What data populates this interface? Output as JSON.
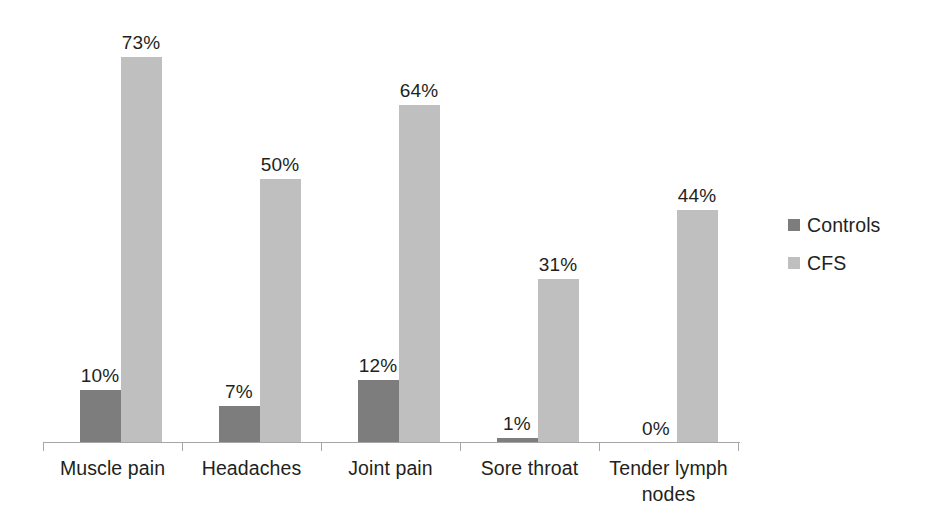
{
  "chart_data": {
    "type": "bar",
    "title": "",
    "subtitle": "",
    "xlabel": "",
    "ylabel": "",
    "ylim": [
      0,
      73
    ],
    "grid": false,
    "legend_position": "right",
    "orientation": "vertical",
    "grouping": "grouped",
    "value_suffix": "%",
    "categories": [
      "Muscle pain",
      "Headaches",
      "Joint pain",
      "Sore throat",
      "Tender lymph nodes"
    ],
    "series": [
      {
        "name": "Controls",
        "color": "#7d7d7d",
        "values": [
          10,
          7,
          12,
          1,
          0
        ],
        "labels": [
          "10%",
          "7%",
          "12%",
          "1%",
          "0%"
        ]
      },
      {
        "name": "CFS",
        "color": "#bfbfbf",
        "values": [
          73,
          50,
          64,
          31,
          44
        ],
        "labels": [
          "73%",
          "50%",
          "64%",
          "31%",
          "44%"
        ]
      }
    ]
  },
  "axis": {
    "line_color": "#a6a6a6",
    "tick_count": 4
  },
  "legend": {
    "items": [
      {
        "label": "Controls",
        "color": "#7d7d7d"
      },
      {
        "label": "CFS",
        "color": "#bfbfbf"
      }
    ]
  }
}
